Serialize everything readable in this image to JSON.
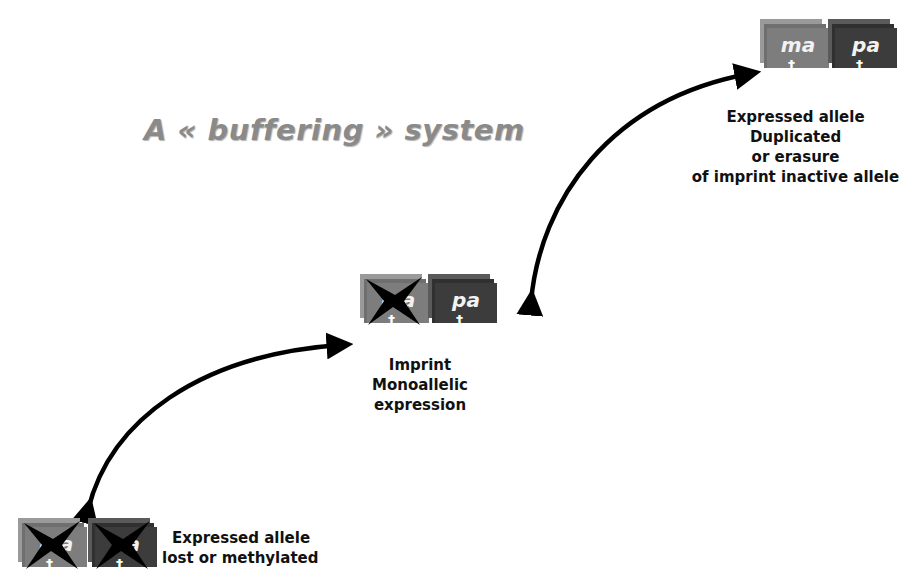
{
  "title": "A « buffering » system",
  "colors": {
    "title": "#8a8a8a",
    "maternal_allele": "#7d7d7d",
    "paternal_allele": "#3c3c3c",
    "arrow": "#000000",
    "text": "#111111"
  },
  "states": [
    {
      "id": "top",
      "alleles": [
        {
          "label": "ma",
          "silenced": false,
          "icon": "cross-icon"
        },
        {
          "label": "pa",
          "silenced": false,
          "icon": "cross-icon"
        }
      ],
      "caption": [
        "Expressed allele",
        "Duplicated",
        "or erasure",
        "of imprint inactive allele"
      ]
    },
    {
      "id": "middle",
      "alleles": [
        {
          "label": "ma",
          "silenced": true,
          "icon": "cross-icon"
        },
        {
          "label": "pa",
          "silenced": false,
          "icon": "cross-icon"
        }
      ],
      "caption": [
        "Imprint",
        "Monoallelic",
        "expression"
      ]
    },
    {
      "id": "bottom",
      "alleles": [
        {
          "label": "ma",
          "silenced": true,
          "icon": "cross-icon"
        },
        {
          "label": "pa",
          "silenced": true,
          "icon": "cross-icon"
        }
      ],
      "caption": [
        "Expressed allele",
        "lost or methylated"
      ]
    }
  ],
  "arrows": [
    {
      "from": "middle",
      "to": "top",
      "direction": "bidirectional"
    },
    {
      "from": "bottom",
      "to": "middle",
      "direction": "bidirectional"
    }
  ]
}
